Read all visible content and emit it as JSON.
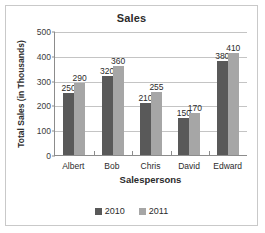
{
  "chart_data": {
    "type": "bar",
    "title": "Sales",
    "xlabel": "Salespersons",
    "ylabel": "Total Sales (in Thousands)",
    "categories": [
      "Albert",
      "Bob",
      "Chris",
      "David",
      "Edward"
    ],
    "series": [
      {
        "name": "2010",
        "color": "#595959",
        "values": [
          250,
          320,
          210,
          150,
          380
        ]
      },
      {
        "name": "2011",
        "color": "#a6a6a6",
        "values": [
          290,
          360,
          255,
          170,
          410
        ]
      }
    ],
    "ylim": [
      0,
      500
    ],
    "ytick_labels": [
      "500",
      "400",
      "300",
      "200",
      "100",
      "0"
    ],
    "ytick_values": [
      500,
      400,
      300,
      200,
      100,
      0
    ],
    "grid": true,
    "data_labels": true,
    "legend_position": "bottom"
  },
  "legend": {
    "items": [
      {
        "label": "2010",
        "color": "#595959"
      },
      {
        "label": "2011",
        "color": "#a6a6a6"
      }
    ]
  }
}
